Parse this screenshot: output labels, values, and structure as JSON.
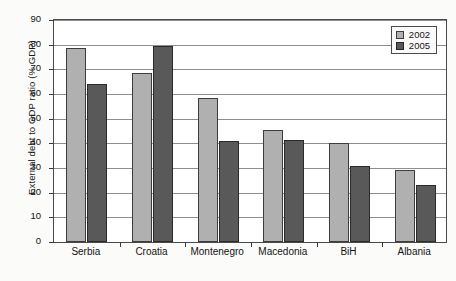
{
  "chart_data": {
    "type": "bar",
    "title": "",
    "xlabel": "",
    "ylabel": "External debt to GDP ratio (% GDP)",
    "ylim": [
      0,
      90
    ],
    "ytick_step": 10,
    "yticks": [
      0,
      10,
      20,
      30,
      40,
      50,
      60,
      70,
      80,
      90
    ],
    "grid": true,
    "legend_position": "top-right",
    "categories": [
      "Serbia",
      "Croatia",
      "Montenegro",
      "Macedonia",
      "BiH",
      "Albania"
    ],
    "series": [
      {
        "name": "2002",
        "color": "#b0b0b0",
        "values": [
          78.5,
          68.5,
          58.5,
          45.5,
          40.0,
          29.0
        ]
      },
      {
        "name": "2005",
        "color": "#595959",
        "values": [
          64.0,
          79.5,
          41.0,
          41.5,
          31.0,
          23.0
        ]
      }
    ]
  },
  "legend": {
    "items": [
      {
        "label": "2002"
      },
      {
        "label": "2005"
      }
    ]
  }
}
